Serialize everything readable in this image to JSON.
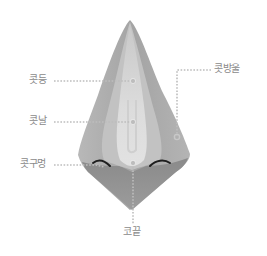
{
  "diagram": {
    "colors": {
      "background": "#ffffff",
      "nose_outer": "#a8a8a8",
      "nose_mid": "#c4c4c4",
      "nose_ridge": "#dedede",
      "nose_bottom": "#8e8e8e",
      "nostril": "#1e1e1e",
      "leader_line": "#b9b9b9",
      "label_text": "#8a8a8a"
    },
    "labels": [
      {
        "id": "bridge",
        "text": "콧등"
      },
      {
        "id": "ridge",
        "text": "콧날"
      },
      {
        "id": "nostril",
        "text": "콧구멍"
      },
      {
        "id": "ala",
        "text": "콧방울"
      },
      {
        "id": "tip",
        "text": "코끝"
      }
    ]
  }
}
